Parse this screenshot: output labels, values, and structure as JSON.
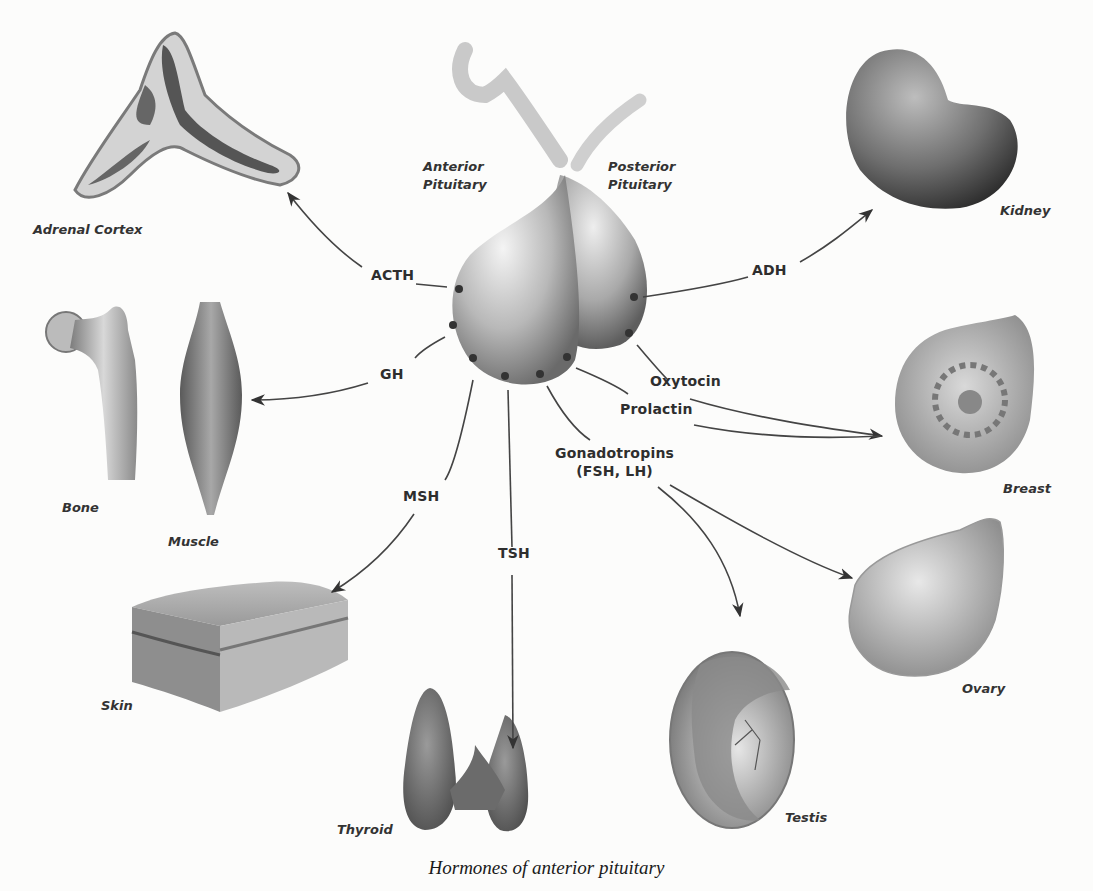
{
  "figure": {
    "caption": "Hormones of anterior pituitary",
    "gland_labels": {
      "anterior": [
        "Anterior",
        "Pituitary"
      ],
      "posterior": [
        "Posterior",
        "Pituitary"
      ]
    },
    "hormones": {
      "acth": "ACTH",
      "adh": "ADH",
      "gh": "GH",
      "oxytocin": "Oxytocin",
      "prolactin": "Prolactin",
      "gonadotropins": [
        "Gonadotropins",
        "(FSH, LH)"
      ],
      "msh": "MSH",
      "tsh": "TSH"
    },
    "organs": {
      "adrenal_cortex": "Adrenal Cortex",
      "kidney": "Kidney",
      "bone": "Bone",
      "muscle": "Muscle",
      "breast": "Breast",
      "skin": "Skin",
      "thyroid": "Thyroid",
      "testis": "Testis",
      "ovary": "Ovary"
    },
    "connections": [
      {
        "hormone": "ACTH",
        "source": "Anterior Pituitary",
        "target": "Adrenal Cortex"
      },
      {
        "hormone": "ADH",
        "source": "Posterior Pituitary",
        "target": "Kidney"
      },
      {
        "hormone": "GH",
        "source": "Anterior Pituitary",
        "target": "Bone, Muscle"
      },
      {
        "hormone": "Oxytocin",
        "source": "Posterior Pituitary",
        "target": "Breast"
      },
      {
        "hormone": "Prolactin",
        "source": "Anterior Pituitary",
        "target": "Breast"
      },
      {
        "hormone": "Gonadotropins (FSH, LH)",
        "source": "Anterior Pituitary",
        "target": "Testis, Ovary"
      },
      {
        "hormone": "MSH",
        "source": "Anterior Pituitary",
        "target": "Skin"
      },
      {
        "hormone": "TSH",
        "source": "Anterior Pituitary",
        "target": "Thyroid"
      }
    ]
  }
}
